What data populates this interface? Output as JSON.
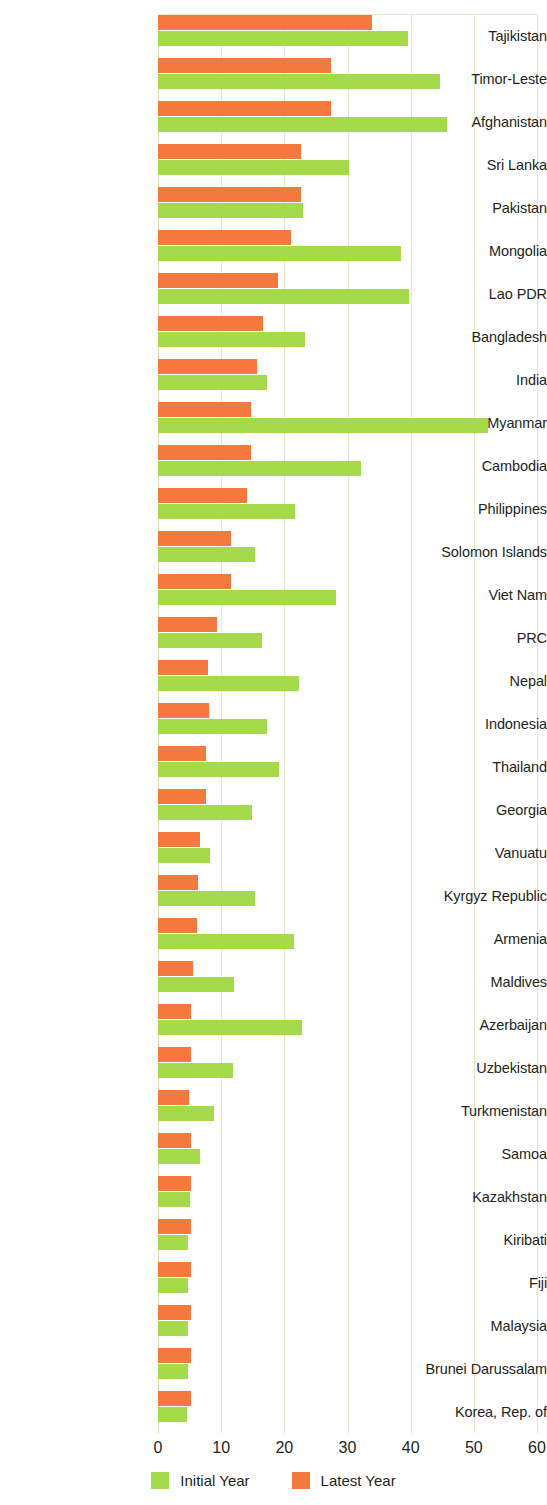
{
  "chart_data": {
    "type": "bar",
    "orientation": "horizontal",
    "title": "",
    "xlabel": "",
    "ylabel": "",
    "xlim": [
      0,
      60
    ],
    "xticks": [
      0,
      10,
      20,
      30,
      40,
      50,
      60
    ],
    "grid": true,
    "legend_position": "bottom-center",
    "categories": [
      "Tajikistan",
      "Timor-Leste",
      "Afghanistan",
      "Sri Lanka",
      "Pakistan",
      "Mongolia",
      "Lao PDR",
      "Bangladesh",
      "India",
      "Myanmar",
      "Cambodia",
      "Philippines",
      "Solomon Islands",
      "Viet Nam",
      "PRC",
      "Nepal",
      "Indonesia",
      "Thailand",
      "Georgia",
      "Vanuatu",
      "Kyrgyz Republic",
      "Armenia",
      "Maldives",
      "Azerbaijan",
      "Uzbekistan",
      "Turkmenistan",
      "Samoa",
      "Kazakhstan",
      "Kiribati",
      "Fiji",
      "Malaysia",
      "Brunei Darussalam",
      "Korea, Rep. of"
    ],
    "series": [
      {
        "name": "Initial Year",
        "color": "#a5da4b",
        "values": [
          39.5,
          44.7,
          45.8,
          30.2,
          23.0,
          38.5,
          39.7,
          23.3,
          17.3,
          52.2,
          32.2,
          21.7,
          15.4,
          28.2,
          16.5,
          22.4,
          17.2,
          19.2,
          14.9,
          8.2,
          15.3,
          21.5,
          12.1,
          22.8,
          11.8,
          8.9,
          6.6,
          5.0,
          4.8,
          4.8,
          4.8,
          4.8,
          4.6
        ]
      },
      {
        "name": "Latest Year",
        "color": "#f4793f",
        "values": [
          33.8,
          27.4,
          27.4,
          22.6,
          22.6,
          21.1,
          19.0,
          16.7,
          15.6,
          14.8,
          14.8,
          14.1,
          11.5,
          11.5,
          9.4,
          7.9,
          8.0,
          7.6,
          7.6,
          6.7,
          6.3,
          6.1,
          5.6,
          5.2,
          5.2,
          4.9,
          5.2,
          5.3,
          5.2,
          5.2,
          5.2,
          5.2,
          5.2
        ]
      }
    ]
  },
  "legend": {
    "items": [
      {
        "label": "Initial Year",
        "color": "#a5da4b"
      },
      {
        "label": "Latest Year",
        "color": "#f4793f"
      }
    ]
  },
  "axis": {
    "tick_labels": [
      "0",
      "10",
      "20",
      "30",
      "40",
      "50",
      "60"
    ]
  }
}
